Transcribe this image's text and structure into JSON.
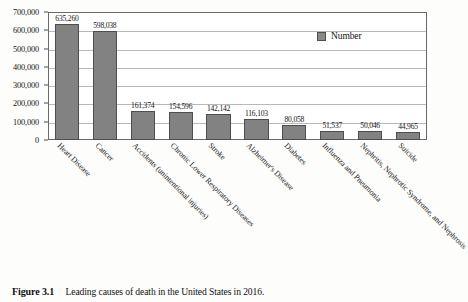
{
  "figure": {
    "caption_label": "Figure 3.1",
    "caption_text": "Leading causes of death in the United States in 2016."
  },
  "legend": {
    "label": "Number",
    "swatch_color": "#8a8a8a",
    "position": "top-right-inside"
  },
  "chart_data": {
    "type": "bar",
    "title": "",
    "xlabel": "",
    "ylabel": "",
    "ylim": [
      0,
      700000
    ],
    "grid": true,
    "legend_position": "top-right-inside",
    "y_ticks": [
      "0",
      "100,000",
      "200,000",
      "300,000",
      "400,000",
      "500,000",
      "600,000",
      "700,000"
    ],
    "y_tick_values": [
      0,
      100000,
      200000,
      300000,
      400000,
      500000,
      600000,
      700000
    ],
    "categories": [
      "Heart Disease",
      "Cancer",
      "Accidents (unintentional injuries)",
      "Chronic Lower Respiratory Diseases",
      "Stroke",
      "Alzheimer's Disease",
      "Diabetes",
      "Influenza and Pneumonia",
      "Nephritis, Nephrotic Syndrome, and Nephrosis",
      "Suicide"
    ],
    "series": [
      {
        "name": "Number",
        "values": [
          635260,
          598038,
          161374,
          154596,
          142142,
          116103,
          80058,
          51537,
          50046,
          44965
        ],
        "labels": [
          "635,260",
          "598,038",
          "161,374",
          "154,596",
          "142,142",
          "116,103",
          "80,058",
          "51,537",
          "50,046",
          "44,965"
        ],
        "color": "#828282"
      }
    ]
  }
}
